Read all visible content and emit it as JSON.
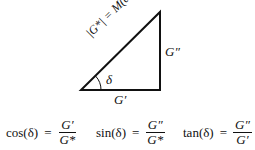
{
  "diagram": {
    "hypotenuse_label": "|G*| = M(ω)",
    "vertical_label": "G″",
    "horizontal_label": "G′",
    "angle_label": "δ"
  },
  "equations": [
    {
      "fn": "cos(δ)",
      "eq": "=",
      "num": "G′",
      "den": "G*"
    },
    {
      "fn": "sin(δ)",
      "eq": "=",
      "num": "G″",
      "den": "G*"
    },
    {
      "fn": "tan(δ)",
      "eq": "=",
      "num": "G″",
      "den": "G′"
    }
  ]
}
